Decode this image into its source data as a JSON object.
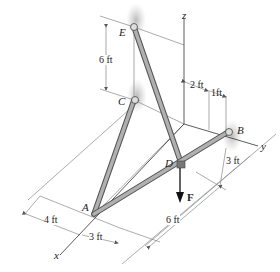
{
  "figure": {
    "points": {
      "A": {
        "label": "A"
      },
      "B": {
        "label": "B"
      },
      "C": {
        "label": "C"
      },
      "D": {
        "label": "D"
      },
      "E": {
        "label": "E"
      }
    },
    "axes": {
      "x": "x",
      "y": "y",
      "z": "z"
    },
    "force": {
      "label": "F"
    },
    "dimensions": {
      "ec_height": "6 ft",
      "z_to_mid": "2 ft",
      "mid_to_b": "1ft",
      "b_to_d": "3 ft",
      "d_to_edge": "6 ft",
      "left_offset": "4 ft",
      "a_offset": "3 ft"
    },
    "colors": {
      "member": "#9a9a9a",
      "member_edge": "#555555",
      "support_shadow": "#bdbdbd",
      "line": "#444444",
      "dim_line": "#888888"
    }
  }
}
